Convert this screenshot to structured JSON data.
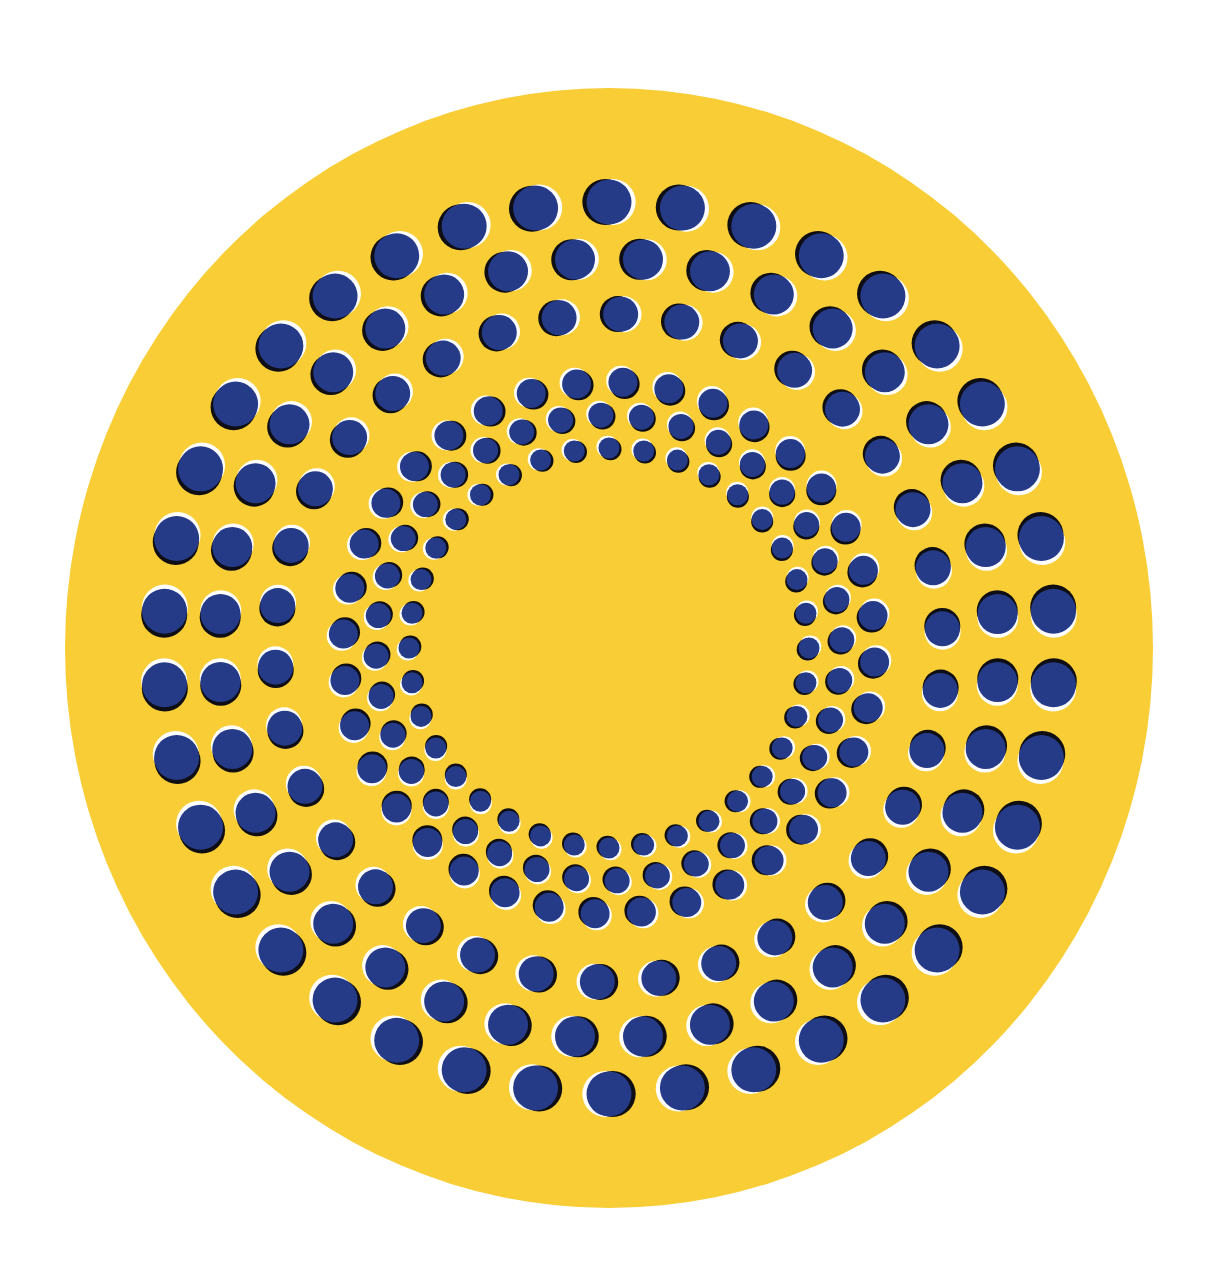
{
  "artwork": {
    "title": "Rotating rings optical illusion",
    "canvas": {
      "width": 1221,
      "height": 1271,
      "background": "#ffffff"
    },
    "disc": {
      "cx": 609,
      "cy": 648,
      "rx": 544,
      "ry": 560,
      "fill": "#F8CD36"
    },
    "colors": {
      "dot": "#263B87",
      "shadow": "#0e0e14",
      "highlight": "#ffffff",
      "yellow": "#F8CD36"
    },
    "rings": [
      {
        "name": "outer-ring-1",
        "radius": 446,
        "count": 38,
        "dot_diameter": 46,
        "direction": "cw",
        "offset_deg": 0
      },
      {
        "name": "outer-ring-2",
        "radius": 390,
        "count": 36,
        "dot_diameter": 41,
        "direction": "cw",
        "offset_deg": 5
      },
      {
        "name": "outer-ring-3",
        "radius": 334,
        "count": 34,
        "dot_diameter": 36,
        "direction": "cw",
        "offset_deg": 2
      },
      {
        "name": "inner-ring-1",
        "radius": 266,
        "count": 36,
        "dot_diameter": 30,
        "direction": "ccw",
        "offset_deg": 3
      },
      {
        "name": "inner-ring-2",
        "radius": 233,
        "count": 36,
        "dot_diameter": 26,
        "direction": "ccw",
        "offset_deg": 8
      },
      {
        "name": "inner-ring-3",
        "radius": 200,
        "count": 36,
        "dot_diameter": 22,
        "direction": "ccw",
        "offset_deg": 0
      }
    ]
  }
}
